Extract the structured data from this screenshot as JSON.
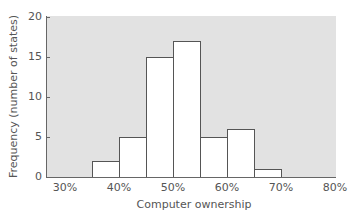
{
  "chart_data": {
    "type": "bar",
    "subtype": "histogram",
    "title": "",
    "xlabel": "Computer ownership",
    "ylabel": "Frequency (number of states)",
    "ylim": [
      0,
      20
    ],
    "xlim": [
      "30%",
      "80%"
    ],
    "y_ticks": [
      "0",
      "5",
      "10",
      "15",
      "20"
    ],
    "x_ticks": [
      "30%",
      "40%",
      "50%",
      "60%",
      "70%",
      "80%"
    ],
    "bin_width": "5%",
    "categories": [
      "35-40%",
      "40-45%",
      "45-50%",
      "50-55%",
      "55-60%",
      "60-65%",
      "65-70%"
    ],
    "bins": [
      {
        "start": 35,
        "end": 40,
        "value": 2
      },
      {
        "start": 40,
        "end": 45,
        "value": 5
      },
      {
        "start": 45,
        "end": 50,
        "value": 15
      },
      {
        "start": 50,
        "end": 55,
        "value": 17
      },
      {
        "start": 55,
        "end": 60,
        "value": 5
      },
      {
        "start": 60,
        "end": 65,
        "value": 6
      },
      {
        "start": 65,
        "end": 70,
        "value": 1
      }
    ],
    "values": [
      2,
      5,
      15,
      17,
      5,
      6,
      1
    ],
    "grid": false,
    "legend": null,
    "colors": {
      "plot_background": "#e2e2e2",
      "bar_fill": "#ffffff",
      "bar_edge": "#555555"
    }
  }
}
